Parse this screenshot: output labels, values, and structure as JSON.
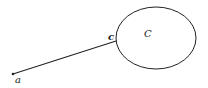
{
  "diagram": {
    "labels": {
      "point_a": "a",
      "point_c": "c",
      "region_C": "C"
    },
    "colors": {
      "stroke": "#222222",
      "background": "#ffffff"
    }
  }
}
